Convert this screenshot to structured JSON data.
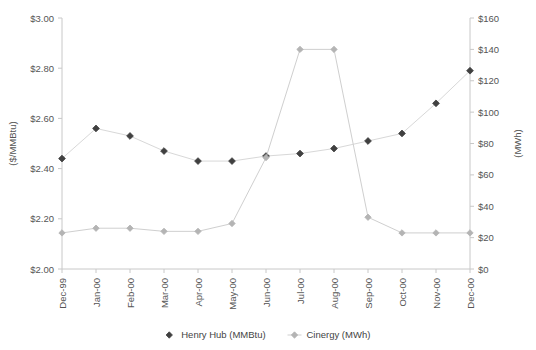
{
  "chart_data": {
    "type": "line",
    "title": "",
    "subtitle": "",
    "xlabel": "",
    "categories": [
      "Dec-99",
      "Jan-00",
      "Feb-00",
      "Mar-00",
      "Apr-00",
      "May-00",
      "Jun-00",
      "Jul-00",
      "Aug-00",
      "Sep-00",
      "Oct-00",
      "Nov-00",
      "Dec-00"
    ],
    "grid": false,
    "legend_position": "bottom",
    "axes": {
      "left": {
        "label": "($/MMBtu)",
        "ylim": [
          2.0,
          3.0
        ],
        "ticks": [
          2.0,
          2.2,
          2.4,
          2.6,
          2.8,
          3.0
        ],
        "tick_labels": [
          "$2.00",
          "$2.20",
          "$2.40",
          "$2.60",
          "$2.80",
          "$3.00"
        ]
      },
      "right": {
        "label": "(MWh)",
        "ylim": [
          0,
          160
        ],
        "ticks": [
          0,
          20,
          40,
          60,
          80,
          100,
          120,
          140,
          160
        ],
        "tick_labels": [
          "$0",
          "$20",
          "$40",
          "$60",
          "$80",
          "$100",
          "$120",
          "$140",
          "$160"
        ]
      }
    },
    "series": [
      {
        "name": "Henry Hub (MMBtu)",
        "axis": "left",
        "marker": "diamond",
        "color": "#404040",
        "line_color": "#d8d8d8",
        "values": [
          2.44,
          2.56,
          2.53,
          2.47,
          2.43,
          2.43,
          2.45,
          2.46,
          2.48,
          2.51,
          2.54,
          2.66,
          2.79
        ]
      },
      {
        "name": "Cinergy (MWh)",
        "axis": "right",
        "marker": "diamond",
        "color": "#b4b4b4",
        "line_color": "#cfcfcf",
        "values": [
          23,
          26,
          26,
          24,
          24,
          29,
          71,
          140,
          140,
          33,
          23,
          23,
          23
        ]
      }
    ]
  },
  "legend": {
    "items": [
      {
        "label": "Henry Hub (MMBtu)"
      },
      {
        "label": "Cinergy (MWh)"
      }
    ]
  }
}
